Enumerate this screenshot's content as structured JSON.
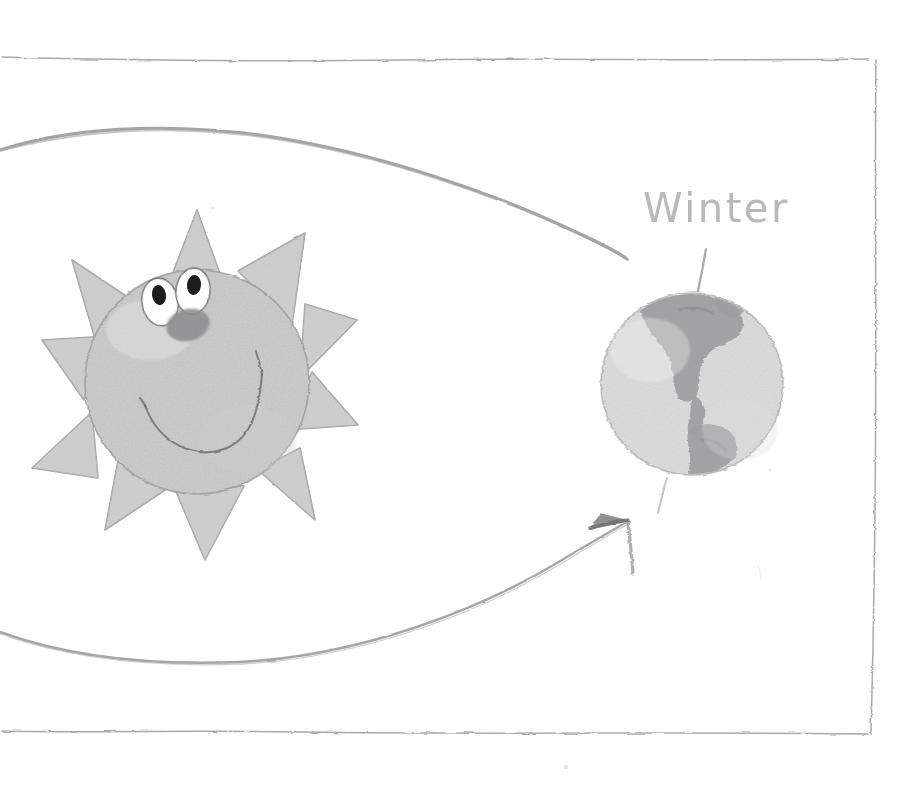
{
  "diagram": {
    "kind": "hand-drawn-pencil-sketch",
    "medium": "pencil on white paper",
    "labels": {
      "winter": "Winter"
    },
    "colors": {
      "paper": "#fefefe",
      "pencil_line": "#8d8d92",
      "pencil_line_light": "#b9b9bc",
      "frame_line": "#9a9a9e",
      "sun_fill": "#d9d9d9",
      "sun_outline": "#9e9e9e",
      "globe_fill": "#e4e4e4",
      "globe_outline": "#a8a8ab",
      "continent_fill": "#9d9da0",
      "eye_white": "#fdfdfd",
      "pupil": "#1d1d1d",
      "nose_fill": "#8f8f91",
      "mouth_line": "#6f6f72"
    },
    "elements": [
      {
        "name": "frame-border-top",
        "type": "hand-drawn-line"
      },
      {
        "name": "frame-border-right",
        "type": "hand-drawn-line"
      },
      {
        "name": "frame-border-bottom",
        "type": "hand-drawn-line"
      },
      {
        "name": "orbit-arc-upper",
        "type": "curved-path"
      },
      {
        "name": "orbit-arc-lower-with-arrow",
        "type": "curved-path-arrow"
      },
      {
        "name": "sun-with-face",
        "type": "illustration"
      },
      {
        "name": "earth-globe",
        "type": "illustration"
      },
      {
        "name": "earth-axis-line",
        "type": "tilted-line"
      },
      {
        "name": "winter-label",
        "type": "handwritten-text"
      }
    ],
    "sun": {
      "center": {
        "x": 197,
        "y": 382
      },
      "body_radius": 112,
      "ray_count": 10,
      "ray_tip_radius": 163,
      "face": {
        "eyes": 2,
        "nose": 1,
        "mouth": "smile"
      }
    },
    "earth": {
      "center": {
        "x": 692,
        "y": 384
      },
      "radius": 91,
      "continent": "Americas",
      "axis_tilt_degrees": 9,
      "axis_top": {
        "x": 706,
        "y": 248
      },
      "axis_bottom": {
        "x": 659,
        "y": 512
      }
    },
    "arrowhead": {
      "tip": {
        "x": 628,
        "y": 521
      },
      "direction": "up-right"
    }
  }
}
